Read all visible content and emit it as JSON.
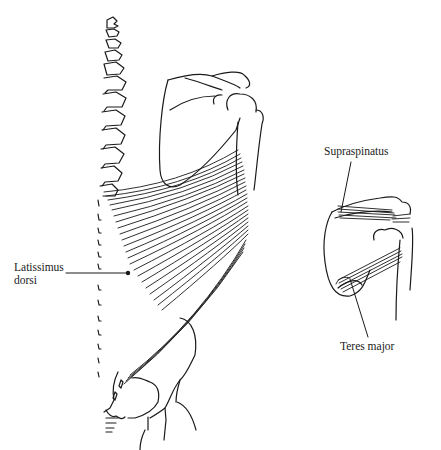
{
  "figure": {
    "labels": {
      "latissimus_line1": "Latissimus",
      "latissimus_line2": "dorsi",
      "supraspinatus": "Supraspinatus",
      "teres_major": "Teres major"
    }
  },
  "colors": {
    "background": "#ffffff",
    "ink": "#1a1a1a"
  }
}
